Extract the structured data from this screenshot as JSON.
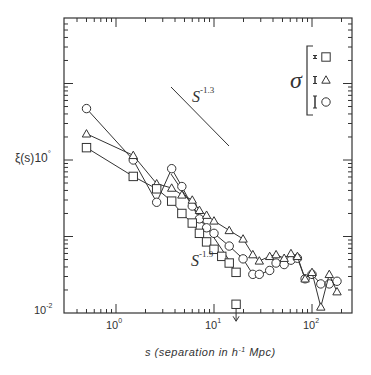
{
  "chart_data": {
    "type": "scatter",
    "title": "",
    "xlabel": "s (separation in h^-1 Mpc)",
    "ylabel": "ξ(s)",
    "xscale": "log",
    "yscale": "log",
    "xlim": [
      0.3,
      250
    ],
    "ylim": [
      0.01,
      12
    ],
    "grid": false,
    "x_ticks": [
      "10^0",
      "10^1",
      "10^2"
    ],
    "y_ticks": [
      "10^-2",
      "10^0"
    ],
    "legend": {
      "position": "upper right",
      "title": "σ",
      "entries": [
        {
          "marker": "square",
          "error_bar": "tiny"
        },
        {
          "marker": "triangle",
          "error_bar": "small"
        },
        {
          "marker": "circle",
          "error_bar": "large"
        }
      ]
    },
    "reference_lines": [
      {
        "label": "s^-1.3",
        "slope": -1.3
      },
      {
        "label": "s^-1.9",
        "slope": -1.9
      }
    ],
    "series": [
      {
        "name": "circle",
        "marker": "circle",
        "x": [
          0.5,
          1.5,
          2.6,
          3.7,
          4.7,
          6.0,
          7.1,
          8.4,
          10.0,
          14.3,
          19.8,
          24.9,
          29.0,
          37.0,
          43.0,
          52.0,
          61.0,
          71.0,
          85.0,
          100.0,
          123.0,
          150.0,
          180.0
        ],
        "y": [
          4.7,
          1.0,
          0.28,
          0.77,
          0.45,
          0.25,
          0.17,
          0.13,
          0.11,
          0.075,
          0.051,
          0.032,
          0.032,
          0.036,
          0.045,
          0.043,
          0.049,
          0.052,
          0.028,
          0.032,
          0.024,
          0.024,
          0.026
        ]
      },
      {
        "name": "triangle",
        "marker": "triangle",
        "x": [
          0.5,
          1.5,
          2.6,
          3.7,
          4.7,
          6.0,
          7.1,
          8.4,
          10.0,
          14.3,
          19.8,
          24.9,
          29.0,
          37.0,
          43.0,
          52.0,
          61.0,
          71.0,
          85.0,
          100.0,
          123.0,
          150.0,
          180.0
        ],
        "y": [
          2.2,
          1.15,
          0.49,
          0.43,
          0.35,
          0.3,
          0.22,
          0.19,
          0.16,
          0.12,
          0.093,
          0.058,
          0.048,
          0.055,
          0.058,
          0.052,
          0.06,
          0.055,
          0.028,
          0.034,
          0.012,
          0.032,
          0.019
        ]
      },
      {
        "name": "square",
        "marker": "square",
        "x": [
          0.5,
          1.5,
          2.6,
          3.7,
          4.7,
          6.0,
          7.1,
          8.4,
          10.0,
          12.0,
          14.3,
          16.8
        ],
        "y": [
          1.45,
          0.61,
          0.42,
          0.29,
          0.2,
          0.15,
          0.11,
          0.085,
          0.068,
          0.055,
          0.045,
          0.034
        ],
        "upper_limit": {
          "x": 16.8,
          "y": 0.013
        }
      }
    ]
  },
  "labels": {
    "ylabel_main": "ξ(s)",
    "ylabel_mult": "10",
    "ylabel_mult_exp": "°",
    "xlabel_main": "s (separation in h",
    "xlabel_exp": "-1",
    "xlabel_tail": " Mpc)",
    "ytick_low_base": "10",
    "ytick_low_exp": "-2",
    "xtick_0_base": "10",
    "xtick_0_exp": "0",
    "xtick_1_base": "10",
    "xtick_1_exp": "1",
    "xtick_2_base": "10",
    "xtick_2_exp": "2",
    "slope1_base": "S",
    "slope1_exp": "-1.3",
    "slope2_base": "S",
    "slope2_exp": "-1.9",
    "sigma": "σ"
  }
}
